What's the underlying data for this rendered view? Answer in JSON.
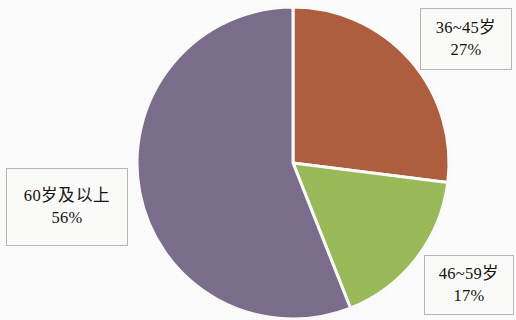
{
  "figure": {
    "background_color": "#ffffff",
    "border_color": "#b9b9b4"
  },
  "chart_data": {
    "type": "pie",
    "title": "",
    "subtitle": "",
    "xlabel": "",
    "ylabel": "",
    "legend_position": "callout-labels",
    "grid": false,
    "start_angle_deg": 0,
    "direction": "clockwise",
    "center": {
      "x": 293,
      "y": 163
    },
    "radius": 156,
    "categories": [
      "36~45岁",
      "46~59岁",
      "60岁及以上"
    ],
    "values": [
      27,
      17,
      56
    ],
    "value_labels": [
      "27%",
      "17%",
      "56%"
    ],
    "colors": [
      "#b0603f",
      "#9bbc5b",
      "#7d6e8e"
    ],
    "slices": [
      {
        "name": "36~45岁",
        "value": 27,
        "value_label": "27%",
        "color": "#b0603f",
        "start_deg": 0,
        "end_deg": 97.2
      },
      {
        "name": "46~59岁",
        "value": 17,
        "value_label": "17%",
        "color": "#9bbc5b",
        "start_deg": 97.2,
        "end_deg": 158.4
      },
      {
        "name": "60岁及以上",
        "value": 56,
        "value_label": "56%",
        "color": "#7d6e8e",
        "start_deg": 158.4,
        "end_deg": 360
      }
    ]
  },
  "callouts": {
    "mid": {
      "category": "36~45岁",
      "percent": "27%"
    },
    "upper": {
      "category": "46~59岁",
      "percent": "17%"
    },
    "senior": {
      "category": "60岁及以上",
      "percent": "56%"
    }
  }
}
